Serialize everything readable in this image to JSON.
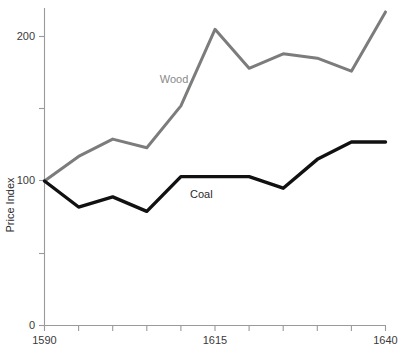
{
  "chart_data": {
    "type": "line",
    "title": "",
    "xlabel": "",
    "ylabel": "Price Index",
    "xlim": [
      1590,
      1640
    ],
    "ylim": [
      0,
      230
    ],
    "xticks": [
      1590,
      1595,
      1600,
      1605,
      1610,
      1615,
      1620,
      1625,
      1630,
      1635,
      1640
    ],
    "xtick_labels": [
      "1590",
      "",
      "",
      "",
      "",
      "1615",
      "",
      "",
      "",
      "",
      "1640"
    ],
    "yticks": [
      0,
      50,
      100,
      150,
      200
    ],
    "ytick_labels": [
      "0",
      "",
      "100",
      "",
      "200"
    ],
    "grid": false,
    "legend": "inline-annotations",
    "x": [
      1590,
      1595,
      1600,
      1605,
      1610,
      1615,
      1620,
      1625,
      1630,
      1635,
      1640
    ],
    "series": [
      {
        "name": "Wood",
        "color": "#7c7c7c",
        "values": [
          100,
          117,
          129,
          123,
          152,
          205,
          178,
          188,
          185,
          176,
          217
        ],
        "label_x": 1609,
        "label_y": 168
      },
      {
        "name": "Coal",
        "color": "#111111",
        "values": [
          100,
          82,
          89,
          79,
          103,
          103,
          103,
          95,
          115,
          127,
          127
        ],
        "label_x": 1613,
        "label_y": 88
      }
    ],
    "annotations": [
      {
        "text": "Wood",
        "color": "#8a8a8a"
      },
      {
        "text": "Coal",
        "color": "#2b2b2b"
      }
    ]
  },
  "axis": {
    "y_title": "Price Index",
    "y_tick_200": "200",
    "y_tick_100": "100",
    "y_tick_0": "0",
    "x_tick_start": "1590",
    "x_tick_mid": "1615",
    "x_tick_end": "1640"
  },
  "labels": {
    "wood": "Wood",
    "coal": "Coal"
  },
  "colors": {
    "wood": "#7c7c7c",
    "coal": "#111111",
    "axis": "#9a9a9a",
    "text": "#2b2b2b",
    "background": "#ffffff"
  }
}
